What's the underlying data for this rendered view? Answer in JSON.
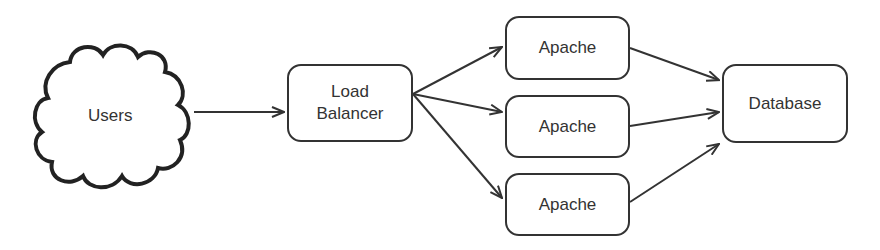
{
  "diagram": {
    "nodes": {
      "users": {
        "label": "Users",
        "shape": "cloud"
      },
      "load_balancer": {
        "label_line1": "Load",
        "label_line2": "Balancer",
        "shape": "rounded-rect"
      },
      "apache_1": {
        "label": "Apache",
        "shape": "rounded-rect"
      },
      "apache_2": {
        "label": "Apache",
        "shape": "rounded-rect"
      },
      "apache_3": {
        "label": "Apache",
        "shape": "rounded-rect"
      },
      "database": {
        "label": "Database",
        "shape": "rounded-rect"
      }
    },
    "edges": [
      {
        "from": "users",
        "to": "load_balancer"
      },
      {
        "from": "load_balancer",
        "to": "apache_1"
      },
      {
        "from": "load_balancer",
        "to": "apache_2"
      },
      {
        "from": "load_balancer",
        "to": "apache_3"
      },
      {
        "from": "apache_1",
        "to": "database"
      },
      {
        "from": "apache_2",
        "to": "database"
      },
      {
        "from": "apache_3",
        "to": "database"
      }
    ],
    "colors": {
      "stroke": "#333333",
      "background": "#ffffff"
    }
  }
}
